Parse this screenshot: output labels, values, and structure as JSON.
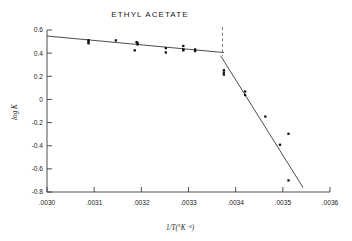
{
  "figure": {
    "background_color": "#ffffff",
    "foreground_color": "#1a1a1a"
  },
  "chart_data": {
    "type": "scatter",
    "title": "ETHYL ACETATE",
    "xlabel": "1/T(°K⁻¹)",
    "ylabel": "log K",
    "xlim": [
      0.003,
      0.0036
    ],
    "ylim": [
      -0.8,
      0.6
    ],
    "xticks": [
      0.003,
      0.0031,
      0.0032,
      0.0033,
      0.0034,
      0.0035,
      0.0036
    ],
    "xticklabels": [
      ".0030",
      ".0031",
      ".0032",
      ".0033",
      ".0034",
      ".0035",
      ".0036"
    ],
    "yticks": [
      0.6,
      0.4,
      0.2,
      0,
      -0.2,
      -0.4,
      -0.6,
      -0.8
    ],
    "yticklabels": [
      "0.6",
      "0.4",
      "0.2",
      "0",
      "-0.2",
      "-0.4",
      "-0.6",
      "-0.8"
    ],
    "grid": false,
    "legend": null,
    "series": [
      {
        "name": "measured log K",
        "marker": "square",
        "color": "#111111",
        "points": [
          [
            0.003088,
            0.512
          ],
          [
            0.003088,
            0.497
          ],
          [
            0.003088,
            0.485
          ],
          [
            0.003146,
            0.51
          ],
          [
            0.00319,
            0.495
          ],
          [
            0.003192,
            0.487
          ],
          [
            0.003192,
            0.475
          ],
          [
            0.003186,
            0.424
          ],
          [
            0.003252,
            0.443
          ],
          [
            0.003252,
            0.406
          ],
          [
            0.003289,
            0.462
          ],
          [
            0.003289,
            0.432
          ],
          [
            0.003289,
            0.424
          ],
          [
            0.003314,
            0.432
          ],
          [
            0.003314,
            0.418
          ],
          [
            0.003375,
            0.252
          ],
          [
            0.003375,
            0.232
          ],
          [
            0.003375,
            0.215
          ],
          [
            0.00342,
            0.068
          ],
          [
            0.00342,
            0.038
          ],
          [
            0.003463,
            -0.148
          ],
          [
            0.003494,
            -0.392
          ],
          [
            0.003512,
            -0.297
          ],
          [
            0.003512,
            -0.7
          ]
        ]
      }
    ],
    "fit_lines": [
      {
        "name": "low-temperature-branch-fit",
        "x": [
          0.003,
          0.003375
        ],
        "y": [
          0.548,
          0.405
        ],
        "color": "#4d4d4d"
      },
      {
        "name": "high-temperature-branch-fit",
        "x": [
          0.003368,
          0.003543
        ],
        "y": [
          0.378,
          -0.762
        ],
        "color": "#4d4d4d"
      }
    ],
    "annotations": [
      {
        "name": "transition-break-line",
        "type": "vertical-dashed-line",
        "x": 0.003372,
        "y_range": [
          0.375,
          0.625
        ],
        "color": "#6a6a6a"
      }
    ]
  }
}
